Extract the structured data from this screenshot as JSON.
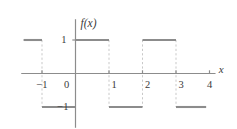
{
  "figure": {
    "function_label": "f(x)",
    "x_axis_label": "x",
    "width": 237,
    "height": 129,
    "line_color": "#8c8c8c",
    "dash_color": "#c9c9c9",
    "axis_color": "#8c8c8c",
    "text_color": "#3a3a3a",
    "background": "#ffffff"
  },
  "axis": {
    "x_ticks": [
      {
        "value": -1,
        "label": "−1"
      },
      {
        "value": 0,
        "label": "0"
      },
      {
        "value": 1,
        "label": "1"
      },
      {
        "value": 2,
        "label": "2"
      },
      {
        "value": 3,
        "label": "3"
      },
      {
        "value": 4,
        "label": "4"
      }
    ],
    "y_ticks": [
      {
        "value": 1,
        "label": "1"
      },
      {
        "value": -1,
        "label": "−1"
      }
    ],
    "xlim": [
      -1.75,
      4.6
    ],
    "ylim": [
      -1.75,
      1.9
    ],
    "grid": false
  },
  "chart_data": {
    "type": "line",
    "title": "",
    "subtitle": "",
    "xlabel": "x",
    "ylabel": "f(x)",
    "xlim": [
      -1.75,
      4.6
    ],
    "ylim": [
      -1.75,
      1.9
    ],
    "grid": false,
    "legend": null,
    "series": [
      {
        "name": "f(x)",
        "style": "step",
        "segments": [
          {
            "x_start": -1.55,
            "x_end": -1.0,
            "y": 1
          },
          {
            "x_start": -1.0,
            "x_end": 0.0,
            "y": -1
          },
          {
            "x_start": 0.0,
            "x_end": 1.0,
            "y": 1
          },
          {
            "x_start": 1.0,
            "x_end": 2.0,
            "y": -1
          },
          {
            "x_start": 2.0,
            "x_end": 3.0,
            "y": 1
          },
          {
            "x_start": 3.0,
            "x_end": 3.9,
            "y": -1
          }
        ]
      }
    ],
    "jump_discontinuities": [
      {
        "x": -1.0,
        "from": 1,
        "to": -1
      },
      {
        "x": 0.0,
        "from": -1,
        "to": 1
      },
      {
        "x": 1.0,
        "from": 1,
        "to": -1
      },
      {
        "x": 2.0,
        "from": -1,
        "to": 1
      },
      {
        "x": 3.0,
        "from": 1,
        "to": -1
      }
    ],
    "period": 2,
    "amplitude": 1
  }
}
